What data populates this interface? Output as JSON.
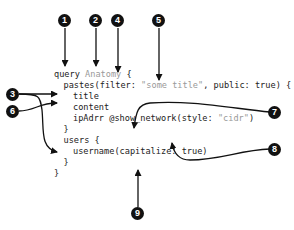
{
  "diagram": {
    "code_lines": [
      {
        "indent": 0,
        "parts": [
          {
            "text": "query ",
            "style": "normal"
          },
          {
            "text": "Anatomy",
            "style": "muted"
          },
          {
            "text": " {",
            "style": "normal"
          }
        ]
      },
      {
        "indent": 1,
        "parts": [
          {
            "text": "pastes(filter: ",
            "style": "normal"
          },
          {
            "text": "\"some title\"",
            "style": "muted"
          },
          {
            "text": ", public: true) {",
            "style": "normal"
          }
        ]
      },
      {
        "indent": 2,
        "parts": [
          {
            "text": "title",
            "style": "normal"
          }
        ]
      },
      {
        "indent": 2,
        "parts": [
          {
            "text": "content",
            "style": "normal"
          }
        ]
      },
      {
        "indent": 2,
        "parts": [
          {
            "text": "ipAdrr @show_network(style: ",
            "style": "normal"
          },
          {
            "text": "\"cidr\"",
            "style": "muted"
          },
          {
            "text": ")",
            "style": "normal"
          }
        ]
      },
      {
        "indent": 1,
        "parts": [
          {
            "text": "}",
            "style": "normal"
          }
        ]
      },
      {
        "indent": 1,
        "parts": [
          {
            "text": "users {",
            "style": "normal"
          }
        ]
      },
      {
        "indent": 2,
        "parts": [
          {
            "text": "username(capitalize: true)",
            "style": "normal"
          }
        ]
      },
      {
        "indent": 1,
        "parts": [
          {
            "text": "}",
            "style": "normal"
          }
        ]
      },
      {
        "indent": 0,
        "parts": [
          {
            "text": "}",
            "style": "normal"
          }
        ]
      }
    ],
    "callouts": [
      {
        "number": "1",
        "target": "query keyword"
      },
      {
        "number": "2",
        "target": "operation name Anatomy"
      },
      {
        "number": "3",
        "target": "fields pastes and users"
      },
      {
        "number": "4",
        "target": "selection set opening brace"
      },
      {
        "number": "5",
        "target": "argument value \"some title\""
      },
      {
        "number": "6",
        "target": "field title"
      },
      {
        "number": "7",
        "target": "directive @show_network"
      },
      {
        "number": "8",
        "target": "directive argument style"
      },
      {
        "number": "9",
        "target": "argument capitalize"
      }
    ],
    "colors": {
      "callout_fill": "#111111",
      "callout_text": "#ffffff",
      "code_text": "#222222",
      "muted_text": "#9a9a9a",
      "arrow": "#111111"
    }
  }
}
